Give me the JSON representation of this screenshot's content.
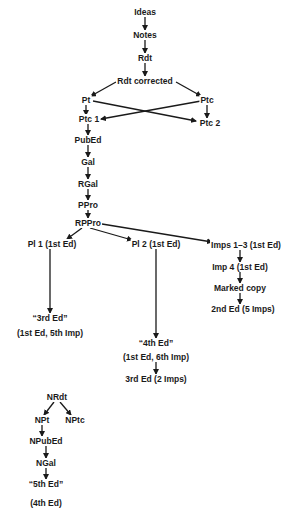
{
  "diagram": {
    "nodes": [
      {
        "id": "ideas",
        "label": "Ideas",
        "x": 145,
        "y": 12
      },
      {
        "id": "notes",
        "label": "Notes",
        "x": 145,
        "y": 35
      },
      {
        "id": "rdt",
        "label": "Rdt",
        "x": 145,
        "y": 58
      },
      {
        "id": "rdt_corrected",
        "label": "Rdt corrected",
        "x": 145,
        "y": 81
      },
      {
        "id": "pt",
        "label": "Pt",
        "x": 86,
        "y": 100
      },
      {
        "id": "ptc",
        "label": "Ptc",
        "x": 207,
        "y": 100
      },
      {
        "id": "ptc1",
        "label": "Ptc 1",
        "x": 89,
        "y": 119
      },
      {
        "id": "ptc2",
        "label": "Ptc 2",
        "x": 210,
        "y": 123
      },
      {
        "id": "pubed",
        "label": "PubEd",
        "x": 88,
        "y": 140
      },
      {
        "id": "gal",
        "label": "Gal",
        "x": 88,
        "y": 162
      },
      {
        "id": "rgal",
        "label": "RGal",
        "x": 88,
        "y": 184
      },
      {
        "id": "ppro",
        "label": "PPro",
        "x": 88,
        "y": 205
      },
      {
        "id": "rppro",
        "label": "RPPro",
        "x": 88,
        "y": 223
      },
      {
        "id": "pl1",
        "label": "Pl 1 (1st Ed)",
        "x": 52,
        "y": 244
      },
      {
        "id": "pl2",
        "label": "Pl 2 (1st Ed)",
        "x": 156,
        "y": 244
      },
      {
        "id": "imps13",
        "label": "Imps 1–3 (1st Ed)",
        "x": 246,
        "y": 245
      },
      {
        "id": "imp4",
        "label": "Imp 4 (1st Ed)",
        "x": 240,
        "y": 267
      },
      {
        "id": "marked",
        "label": "Marked copy",
        "x": 240,
        "y": 288
      },
      {
        "id": "ed2",
        "label": "2nd Ed (5 Imps)",
        "x": 243,
        "y": 309
      },
      {
        "id": "ed3q",
        "label": "“3rd Ed”",
        "x": 50,
        "y": 318
      },
      {
        "id": "ed3q_sub",
        "label": "(1st Ed, 5th Imp)",
        "x": 50,
        "y": 333
      },
      {
        "id": "ed4q",
        "label": "“4th Ed”",
        "x": 156,
        "y": 343
      },
      {
        "id": "ed4q_sub",
        "label": "(1st Ed, 6th Imp)",
        "x": 156,
        "y": 357
      },
      {
        "id": "ed3",
        "label": "3rd Ed (2 Imps)",
        "x": 156,
        "y": 379
      },
      {
        "id": "nrdt",
        "label": "NRdt",
        "x": 57,
        "y": 397
      },
      {
        "id": "npt",
        "label": "NPt",
        "x": 42,
        "y": 420
      },
      {
        "id": "nptc",
        "label": "NPtc",
        "x": 75,
        "y": 420
      },
      {
        "id": "npubed",
        "label": "NPubEd",
        "x": 46,
        "y": 441
      },
      {
        "id": "ngal",
        "label": "NGal",
        "x": 46,
        "y": 463
      },
      {
        "id": "ed5q",
        "label": "“5th Ed”",
        "x": 46,
        "y": 484
      },
      {
        "id": "ed5q_sub",
        "label": "(4th Ed)",
        "x": 46,
        "y": 503
      }
    ],
    "edges": [
      {
        "x1": 145,
        "y1": 17,
        "x2": 145,
        "y2": 30
      },
      {
        "x1": 145,
        "y1": 40,
        "x2": 145,
        "y2": 53
      },
      {
        "x1": 145,
        "y1": 63,
        "x2": 145,
        "y2": 76
      },
      {
        "x1": 116,
        "y1": 82,
        "x2": 91,
        "y2": 96
      },
      {
        "x1": 176,
        "y1": 82,
        "x2": 201,
        "y2": 96
      },
      {
        "x1": 86,
        "y1": 105,
        "x2": 86,
        "y2": 115
      },
      {
        "x1": 93,
        "y1": 101,
        "x2": 196,
        "y2": 121
      },
      {
        "x1": 201,
        "y1": 101,
        "x2": 101,
        "y2": 119
      },
      {
        "x1": 207,
        "y1": 105,
        "x2": 207,
        "y2": 118
      },
      {
        "x1": 88,
        "y1": 124,
        "x2": 88,
        "y2": 135
      },
      {
        "x1": 88,
        "y1": 145,
        "x2": 88,
        "y2": 157
      },
      {
        "x1": 88,
        "y1": 167,
        "x2": 88,
        "y2": 179
      },
      {
        "x1": 88,
        "y1": 189,
        "x2": 88,
        "y2": 200
      },
      {
        "x1": 88,
        "y1": 210,
        "x2": 88,
        "y2": 218
      },
      {
        "x1": 82,
        "y1": 228,
        "x2": 67,
        "y2": 239
      },
      {
        "x1": 90,
        "y1": 228,
        "x2": 132,
        "y2": 240
      },
      {
        "x1": 102,
        "y1": 224,
        "x2": 212,
        "y2": 242
      },
      {
        "x1": 50,
        "y1": 249,
        "x2": 50,
        "y2": 313
      },
      {
        "x1": 156,
        "y1": 249,
        "x2": 156,
        "y2": 338
      },
      {
        "x1": 240,
        "y1": 250,
        "x2": 240,
        "y2": 262
      },
      {
        "x1": 240,
        "y1": 272,
        "x2": 240,
        "y2": 283
      },
      {
        "x1": 240,
        "y1": 293,
        "x2": 240,
        "y2": 304
      },
      {
        "x1": 156,
        "y1": 362,
        "x2": 156,
        "y2": 374
      },
      {
        "x1": 54,
        "y1": 402,
        "x2": 44,
        "y2": 415
      },
      {
        "x1": 60,
        "y1": 402,
        "x2": 71,
        "y2": 415
      },
      {
        "x1": 42,
        "y1": 425,
        "x2": 42,
        "y2": 436
      },
      {
        "x1": 46,
        "y1": 446,
        "x2": 46,
        "y2": 458
      },
      {
        "x1": 46,
        "y1": 468,
        "x2": 46,
        "y2": 479
      }
    ],
    "colors": {
      "ink": "#1a1a1a",
      "background": "#ffffff"
    }
  }
}
